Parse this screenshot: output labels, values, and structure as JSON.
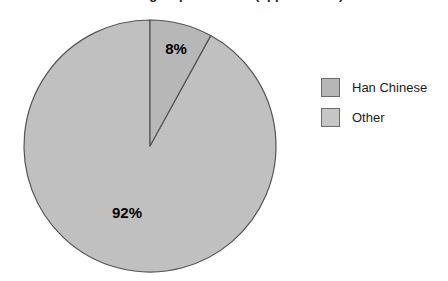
{
  "chart_data": {
    "type": "pie",
    "title": "Ethnic groups in China (approximate)",
    "title_cropped": true,
    "categories": [
      "Han Chinese",
      "Other"
    ],
    "values": [
      92,
      8
    ],
    "value_labels": [
      "92%",
      "8%"
    ],
    "unit": "percent",
    "start_angle_deg": 0,
    "direction": "clockwise",
    "legend_position": "right",
    "grid": false,
    "series": [
      {
        "name": "Population share",
        "slices": [
          {
            "label": "Other",
            "value": 8,
            "display": "8%",
            "color": "#b7b7b7",
            "stroke": "#555555"
          },
          {
            "label": "Han Chinese",
            "value": 92,
            "display": "92%",
            "color": "#c0c0c0",
            "stroke": "#555555"
          }
        ]
      }
    ]
  },
  "geometry": {
    "center_x": 150,
    "center_y": 146,
    "radius": 126,
    "label_8_x": 176,
    "label_8_y": 54,
    "label_92_x": 127,
    "label_92_y": 218
  },
  "labels": {
    "slice_small": "8%",
    "slice_large": "92%"
  },
  "legend": {
    "items": [
      {
        "label": "Han Chinese",
        "color": "#b7b7b7"
      },
      {
        "label": "Other",
        "color": "#c6c6c6"
      }
    ]
  },
  "colors": {
    "background": "#ffffff",
    "slice_han": "#c0c0c0",
    "slice_other": "#b7b7b7",
    "outline": "#555555",
    "text": "#1b1b1b",
    "label_text": "#000000"
  }
}
